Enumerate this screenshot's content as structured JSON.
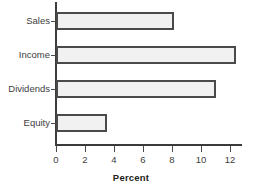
{
  "chart_data": {
    "type": "bar",
    "orientation": "horizontal",
    "title": "",
    "xlabel": "Percent",
    "ylabel": "",
    "categories": [
      "Sales",
      "Income",
      "Dividends",
      "Equity"
    ],
    "values": [
      8.1,
      12.4,
      11.0,
      3.5
    ],
    "xlim": [
      0,
      12.8
    ],
    "xticks": [
      0,
      2,
      4,
      6,
      8,
      10,
      12
    ],
    "xtick_labels": [
      "0",
      "2",
      "4",
      "6",
      "8",
      "10",
      "12"
    ],
    "grid": false,
    "legend": false,
    "bar_fill_color": "#f1f1f1",
    "bar_border_color": "#4a4a4a",
    "axis_color": "#3b3b3b",
    "background_color": "#ffffff"
  }
}
